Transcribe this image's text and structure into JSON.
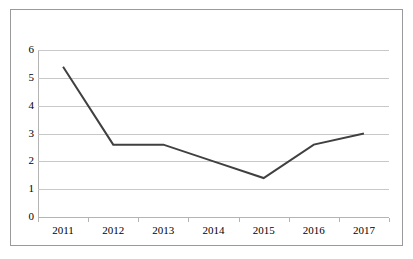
{
  "chart_data": {
    "type": "line",
    "title": "",
    "subtitle": "",
    "caption": "",
    "xlabel": "",
    "ylabel": "",
    "categories": [
      "2011",
      "2012",
      "2013",
      "2014",
      "2015",
      "2016",
      "2017"
    ],
    "values": [
      5.4,
      2.6,
      2.6,
      2.0,
      1.4,
      2.6,
      3.0
    ],
    "series": [
      {
        "name": "",
        "values": [
          5.4,
          2.6,
          2.6,
          2.0,
          1.4,
          2.6,
          3.0
        ]
      }
    ],
    "ylim": [
      0,
      6
    ],
    "y_ticks": [
      "0",
      "1",
      "2",
      "3",
      "4",
      "5",
      "6"
    ],
    "y_tick_values": [
      0,
      1,
      2,
      3,
      4,
      5,
      6
    ],
    "x_ticks": [
      "2011",
      "2012",
      "2013",
      "2014",
      "2015",
      "2016",
      "2017"
    ],
    "grid": true,
    "grid_axis": "y",
    "legend": false,
    "legend_position": "none",
    "markers": false,
    "line_color": "#404040",
    "line_width": 2,
    "gridline_color": "#c8c8c8",
    "axis_color": "#b4b4b4",
    "border_color": "#9a9a9a",
    "background_color": "#ffffff",
    "text_color": "#000000"
  },
  "frame": {
    "border_color": "#9a9a9a"
  }
}
